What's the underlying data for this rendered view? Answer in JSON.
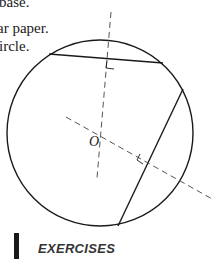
{
  "text_fragments": {
    "line1": "base.",
    "line2": "ar paper.",
    "line3": "ircle."
  },
  "figure": {
    "center_label": "O",
    "circle": {
      "cx": 100,
      "cy": 133,
      "r": 93
    },
    "chords": [
      {
        "x1": 49,
        "y1": 54,
        "x2": 163,
        "y2": 63
      },
      {
        "x1": 183,
        "y1": 89,
        "x2": 118,
        "y2": 226
      }
    ],
    "perpendicular_bisectors": [
      {
        "x1": 111,
        "y1": 12,
        "x2": 97,
        "y2": 178
      },
      {
        "x1": 66,
        "y1": 117,
        "x2": 214,
        "y2": 200
      }
    ],
    "right_angle_marks": 2,
    "line_color": "#1a1a1a",
    "dash_color": "#555555"
  },
  "section": {
    "heading": "EXERCISES"
  }
}
